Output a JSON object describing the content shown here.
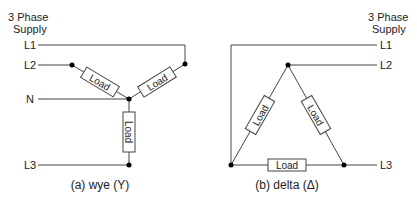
{
  "wye": {
    "supply_line1": "3 Phase",
    "supply_line2": "Supply",
    "lines": {
      "l1": "L1",
      "l2": "L2",
      "n": "N",
      "l3": "L3"
    },
    "loads": [
      "Load",
      "Load",
      "Load"
    ],
    "caption": "(a) wye (Y)"
  },
  "delta": {
    "supply_line1": "3 Phase",
    "supply_line2": "Supply",
    "lines": {
      "l1": "L1",
      "l2": "L2",
      "l3": "L3"
    },
    "loads": [
      "Load",
      "Load",
      "Load"
    ],
    "caption": "(b) delta (Δ)"
  },
  "colors": {
    "wire": "#444444",
    "node": "#000000",
    "text": "#222222"
  }
}
